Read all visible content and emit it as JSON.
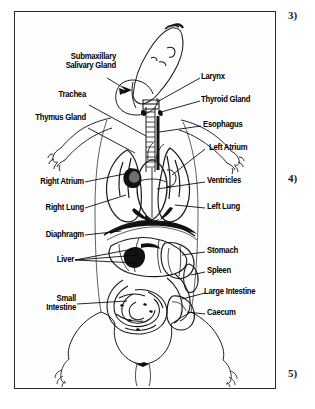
{
  "figure": {
    "view": "ventral"
  },
  "margin_markers": [
    {
      "name": "marker-3",
      "text": "3)"
    },
    {
      "name": "marker-4",
      "text": "4)"
    },
    {
      "name": "marker-5",
      "text": "5)"
    }
  ],
  "labels_left": [
    {
      "id": "submaxillary",
      "line1": "Submaxillary",
      "line2": "Salivary Gland"
    },
    {
      "id": "trachea",
      "line1": "Trachea",
      "line2": ""
    },
    {
      "id": "thymus",
      "line1": "Thymus Gland",
      "line2": ""
    },
    {
      "id": "right-atrium",
      "line1": "Right Atrium",
      "line2": ""
    },
    {
      "id": "right-lung",
      "line1": "Right Lung",
      "line2": ""
    },
    {
      "id": "diaphragm",
      "line1": "Diaphragm",
      "line2": ""
    },
    {
      "id": "liver",
      "line1": "Liver",
      "line2": ""
    },
    {
      "id": "small-intestine",
      "line1": "Small",
      "line2": "Intestine"
    }
  ],
  "labels_right": [
    {
      "id": "larynx",
      "line1": "Larynx",
      "line2": ""
    },
    {
      "id": "thyroid",
      "line1": "Thyroid Gland",
      "line2": ""
    },
    {
      "id": "esophagus",
      "line1": "Esophagus",
      "line2": ""
    },
    {
      "id": "left-atrium",
      "line1": "Left Atrium",
      "line2": ""
    },
    {
      "id": "ventricles",
      "line1": "Ventricles",
      "line2": ""
    },
    {
      "id": "left-lung",
      "line1": "Left Lung",
      "line2": ""
    },
    {
      "id": "stomach",
      "line1": "Stomach",
      "line2": ""
    },
    {
      "id": "spleen",
      "line1": "Spleen",
      "line2": ""
    },
    {
      "id": "large-intestine",
      "line1": "Large Intestine",
      "line2": ""
    },
    {
      "id": "caecum",
      "line1": "Caecum",
      "line2": ""
    }
  ],
  "colors": {
    "ink": "#1a1a1a",
    "frame": "#2b2b2b",
    "paper": "#fefefe",
    "text": "#000000"
  }
}
